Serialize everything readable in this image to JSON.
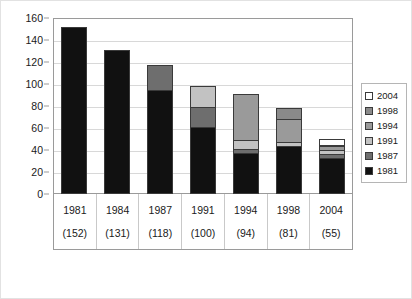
{
  "chart_data": {
    "type": "bar",
    "subtype": "stacked-vertical",
    "title": "",
    "subtitle": "",
    "xlabel": "",
    "ylabel": "",
    "ylim": [
      0,
      160
    ],
    "ytick_step": 20,
    "yticks": [
      0,
      20,
      40,
      60,
      80,
      100,
      120,
      140,
      160
    ],
    "grid": "horizontal",
    "legend_position": "right",
    "categories": [
      "1981",
      "1984",
      "1987",
      "1991",
      "1994",
      "1998",
      "2004"
    ],
    "category_sublabels": [
      "(152)",
      "(131)",
      "(118)",
      "(100)",
      "(94)",
      "(81)",
      "(55)"
    ],
    "category_totals": [
      152,
      131,
      118,
      100,
      94,
      81,
      55
    ],
    "series": [
      {
        "name": "1981",
        "color": "#111111",
        "values": [
          152,
          131,
          95,
          61,
          37,
          44,
          33
        ]
      },
      {
        "name": "1987",
        "color": "#6e6e6e",
        "values": [
          0,
          0,
          23,
          19,
          5,
          0,
          4
        ]
      },
      {
        "name": "1991",
        "color": "#c2c2c2",
        "values": [
          0,
          0,
          0,
          20,
          9,
          4,
          5
        ]
      },
      {
        "name": "1994",
        "color": "#9a9a9a",
        "values": [
          0,
          0,
          0,
          0,
          43,
          22,
          4
        ]
      },
      {
        "name": "1998",
        "color": "#8a8a8a",
        "values": [
          0,
          0,
          0,
          0,
          0,
          11,
          2
        ]
      },
      {
        "name": "2004",
        "color": "#ffffff",
        "values": [
          0,
          0,
          0,
          0,
          0,
          0,
          7
        ]
      }
    ],
    "legend_entries": [
      {
        "label": "2004",
        "color": "#ffffff"
      },
      {
        "label": "1998",
        "color": "#8a8a8a"
      },
      {
        "label": "1994",
        "color": "#9a9a9a"
      },
      {
        "label": "1991",
        "color": "#c2c2c2"
      },
      {
        "label": "1987",
        "color": "#6e6e6e"
      },
      {
        "label": "1981",
        "color": "#111111"
      }
    ]
  }
}
